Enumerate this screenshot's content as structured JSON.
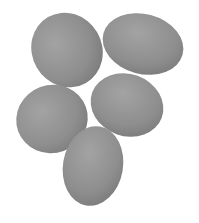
{
  "image": {
    "subject": "five eggs",
    "background_color": "#ffffff",
    "egg_color": "#8f8f8f",
    "egg_highlight": "#a2a2a2",
    "egg_shadow": "#7a7a7a"
  }
}
